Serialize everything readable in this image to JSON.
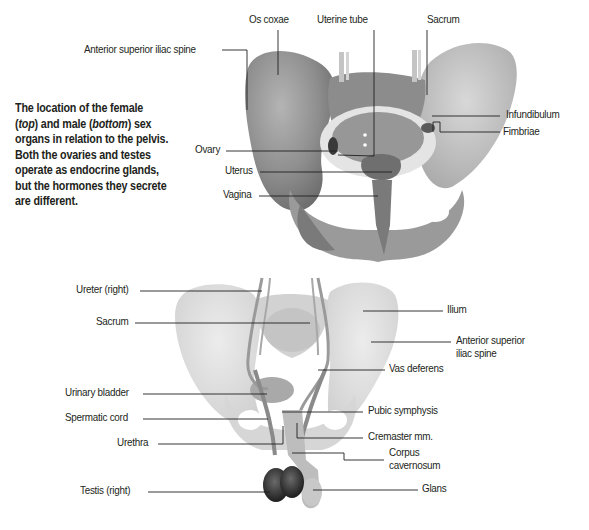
{
  "caption": {
    "line1": "The location of the female",
    "line2_pre": "(",
    "line2_top": "top",
    "line2_mid": ") and male (",
    "line2_bottom": "bottom",
    "line2_post": ") sex",
    "line3": "organs in relation to the pelvis.",
    "line4": "Both the ovaries and testes",
    "line5": "operate as endocrine glands,",
    "line6": "but the hormones they secrete",
    "line7": "are different."
  },
  "female_diagram": {
    "labels": {
      "os_coxae": "Os coxae",
      "uterine_tube": "Uterine tube",
      "sacrum": "Sacrum",
      "anterior_superior_iliac_spine": "Anterior superior iliac spine",
      "infundibulum": "Infundibulum",
      "fimbriae": "Fimbriae",
      "ovary": "Ovary",
      "uterus": "Uterus",
      "vagina": "Vagina"
    }
  },
  "male_diagram": {
    "labels": {
      "ureter_right": "Ureter (right)",
      "sacrum": "Sacrum",
      "ilium": "Ilium",
      "anterior_superior_line1": "Anterior superior",
      "anterior_superior_line2": "iliac spine",
      "vas_deferens": "Vas deferens",
      "urinary_bladder": "Urinary bladder",
      "spermatic_cord": "Spermatic cord",
      "urethra": "Urethra",
      "pubic_symphysis": "Pubic symphysis",
      "cremaster": "Cremaster mm.",
      "corpus_line1": "Corpus",
      "corpus_line2": "cavernosum",
      "testis_right": "Testis (right)",
      "glans": "Glans"
    }
  },
  "colors": {
    "bone_female": "#9a9a9a",
    "bone_male": "#dcdcdc",
    "leader_line": "#231f20",
    "text": "#231f20"
  }
}
